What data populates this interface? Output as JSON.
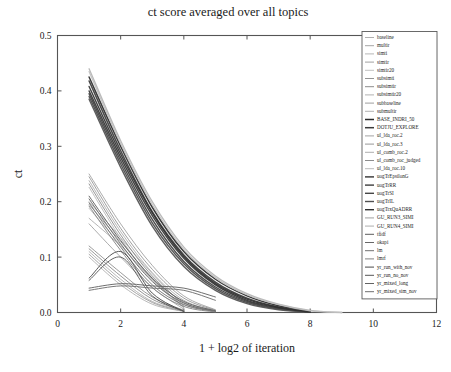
{
  "chart_data": {
    "type": "line",
    "title": "ct score averaged over all topics",
    "xlabel": "1 + log2 of iteration",
    "ylabel": "ct",
    "xlim": [
      0,
      12
    ],
    "ylim": [
      0,
      0.5
    ],
    "xticks": [
      "0",
      "2",
      "4",
      "6",
      "8",
      "10",
      "12"
    ],
    "xtick_values": [
      0,
      2,
      4,
      6,
      8,
      10,
      12
    ],
    "yticks": [
      "0.0",
      "0.1",
      "0.2",
      "0.3",
      "0.4",
      "0.5"
    ],
    "ytick_values": [
      0.0,
      0.1,
      0.2,
      0.3,
      0.4,
      0.5
    ],
    "grid": false,
    "legend_position": "right-outside",
    "x": [
      1,
      2,
      3,
      4,
      5,
      6,
      7,
      8,
      9
    ],
    "series": [
      {
        "name": "baseline",
        "color": "#9a9a9a",
        "width": 0.8,
        "values": [
          0.17,
          0.12,
          0.06,
          0.01,
          null,
          null,
          null,
          null,
          null
        ]
      },
      {
        "name": "multir",
        "color": "#8e8e8e",
        "width": 0.8,
        "values": [
          0.16,
          0.1,
          0.045,
          0.006,
          null,
          null,
          null,
          null,
          null
        ]
      },
      {
        "name": "simti",
        "color": "#a5a5a5",
        "width": 0.8,
        "values": [
          0.2,
          0.135,
          0.07,
          0.012,
          null,
          null,
          null,
          null,
          null
        ]
      },
      {
        "name": "simtir",
        "color": "#8a8a8a",
        "width": 0.8,
        "values": [
          0.195,
          0.128,
          0.062,
          0.009,
          null,
          null,
          null,
          null,
          null
        ]
      },
      {
        "name": "simtir20",
        "color": "#b0b0b0",
        "width": 0.8,
        "values": [
          0.188,
          0.122,
          0.058,
          0.008,
          null,
          null,
          null,
          null,
          null
        ]
      },
      {
        "name": "subsimti",
        "color": "#777777",
        "width": 0.8,
        "values": [
          0.12,
          0.072,
          0.028,
          0.004,
          null,
          null,
          null,
          null,
          null
        ]
      },
      {
        "name": "subsimtir",
        "color": "#6f6f6f",
        "width": 0.8,
        "values": [
          0.115,
          0.066,
          0.024,
          0.003,
          null,
          null,
          null,
          null,
          null
        ]
      },
      {
        "name": "subsimtir20",
        "color": "#9d9d9d",
        "width": 0.8,
        "values": [
          0.11,
          0.06,
          0.02,
          0.003,
          null,
          null,
          null,
          null,
          null
        ]
      },
      {
        "name": "subbaseline",
        "color": "#858585",
        "width": 0.8,
        "values": [
          0.105,
          0.055,
          0.018,
          0.002,
          null,
          null,
          null,
          null,
          null
        ]
      },
      {
        "name": "submultir",
        "color": "#9f9f9f",
        "width": 0.8,
        "values": [
          0.1,
          0.05,
          0.015,
          0.002,
          null,
          null,
          null,
          null,
          null
        ]
      },
      {
        "name": "BASE_INDRI_50",
        "color": "#2a2a2a",
        "width": 1.5,
        "values": [
          0.425,
          0.3,
          0.19,
          0.11,
          0.06,
          0.03,
          0.012,
          0.002,
          null
        ]
      },
      {
        "name": "DOTJU_EXPLORE",
        "color": "#3a3a3a",
        "width": 1.5,
        "values": [
          0.418,
          0.292,
          0.182,
          0.104,
          0.055,
          0.026,
          0.01,
          0.002,
          null
        ]
      },
      {
        "name": "ul_lda_roc.2",
        "color": "#8c8c8c",
        "width": 0.8,
        "values": [
          0.25,
          0.16,
          0.085,
          0.03,
          0.005,
          null,
          null,
          null,
          null
        ]
      },
      {
        "name": "ul_lda_roc.3",
        "color": "#7e7e7e",
        "width": 0.8,
        "values": [
          0.245,
          0.152,
          0.078,
          0.026,
          0.004,
          null,
          null,
          null,
          null
        ]
      },
      {
        "name": "ul_comb_roc.2",
        "color": "#999999",
        "width": 0.8,
        "values": [
          0.238,
          0.146,
          0.072,
          0.022,
          0.003,
          null,
          null,
          null,
          null
        ]
      },
      {
        "name": "ul_comb_roc_judged",
        "color": "#707070",
        "width": 0.8,
        "values": [
          0.232,
          0.14,
          0.066,
          0.018,
          0.002,
          null,
          null,
          null,
          null
        ]
      },
      {
        "name": "ul_lda_roc.10",
        "color": "#a8a8a8",
        "width": 0.8,
        "values": [
          0.226,
          0.134,
          0.06,
          0.015,
          0.002,
          null,
          null,
          null,
          null
        ]
      },
      {
        "name": "uogTrEpsilonG",
        "color": "#333333",
        "width": 1.4,
        "values": [
          0.4,
          0.28,
          0.175,
          0.098,
          0.05,
          0.022,
          0.008,
          0.001,
          null
        ]
      },
      {
        "name": "uogTrRR",
        "color": "#3d3d3d",
        "width": 1.4,
        "values": [
          0.395,
          0.274,
          0.168,
          0.092,
          0.046,
          0.02,
          0.007,
          0.001,
          null
        ]
      },
      {
        "name": "uogTrSI",
        "color": "#464646",
        "width": 1.4,
        "values": [
          0.39,
          0.268,
          0.162,
          0.088,
          0.043,
          0.018,
          0.006,
          0.001,
          null
        ]
      },
      {
        "name": "uogTrIL",
        "color": "#505050",
        "width": 1.4,
        "values": [
          0.385,
          0.262,
          0.156,
          0.083,
          0.04,
          0.016,
          0.005,
          0.001,
          null
        ]
      },
      {
        "name": "uogTrxQuADRR",
        "color": "#2f2f2f",
        "width": 1.4,
        "values": [
          0.408,
          0.286,
          0.18,
          0.101,
          0.052,
          0.024,
          0.009,
          0.001,
          null
        ]
      },
      {
        "name": "GU_RUN3_SIMI",
        "color": "#b4b4b4",
        "width": 1.3,
        "values": [
          0.44,
          0.31,
          0.2,
          0.118,
          0.066,
          0.034,
          0.015,
          0.004,
          0.0
        ]
      },
      {
        "name": "GU_RUN4_SIMI",
        "color": "#c0c0c0",
        "width": 1.3,
        "values": [
          0.435,
          0.305,
          0.195,
          0.114,
          0.063,
          0.032,
          0.014,
          0.003,
          0.0
        ]
      },
      {
        "name": "tfidf",
        "color": "#5c5c5c",
        "width": 1.0,
        "values": [
          0.21,
          0.13,
          0.062,
          0.02,
          0.003,
          null,
          null,
          null,
          null
        ]
      },
      {
        "name": "okapi",
        "color": "#676767",
        "width": 1.0,
        "values": [
          0.205,
          0.124,
          0.056,
          0.017,
          0.002,
          null,
          null,
          null,
          null
        ]
      },
      {
        "name": "lm",
        "color": "#727272",
        "width": 1.0,
        "values": [
          0.198,
          0.118,
          0.05,
          0.014,
          0.002,
          null,
          null,
          null,
          null
        ]
      },
      {
        "name": "lmrf",
        "color": "#838383",
        "width": 1.0,
        "values": [
          0.192,
          0.112,
          0.045,
          0.011,
          0.001,
          null,
          null,
          null,
          null
        ]
      },
      {
        "name": "yr_run_with_nov",
        "color": "#4a4a4a",
        "width": 1.0,
        "values": [
          0.062,
          0.11,
          0.035,
          0.002,
          null,
          null,
          null,
          null,
          null
        ]
      },
      {
        "name": "yr_run_no_nov",
        "color": "#565656",
        "width": 1.0,
        "values": [
          0.058,
          0.1,
          0.03,
          0.002,
          null,
          null,
          null,
          null,
          null
        ]
      },
      {
        "name": "yr_mixed_long",
        "color": "#626262",
        "width": 1.0,
        "values": [
          0.044,
          0.052,
          0.048,
          0.044,
          0.028,
          null,
          null,
          null,
          null
        ]
      },
      {
        "name": "yr_mixed_sim_nov",
        "color": "#6e6e6e",
        "width": 1.0,
        "values": [
          0.04,
          0.048,
          0.044,
          0.04,
          0.022,
          null,
          null,
          null,
          null
        ]
      }
    ]
  },
  "legend": {
    "entries": [
      "baseline",
      "multir",
      "simti",
      "simtir",
      "simtir20",
      "subsimti",
      "subsimtir",
      "subsimtir20",
      "subbaseline",
      "submultir",
      "BASE_INDRI_50",
      "DOTJU_EXPLORE",
      "ul_lda_roc.2",
      "ul_lda_roc.3",
      "ul_comb_roc.2",
      "ul_comb_roc_judged",
      "ul_lda_roc.10",
      "uogTrEpsilonG",
      "uogTrRR",
      "uogTrSI",
      "uogTrIL",
      "uogTrxQuADRR",
      "GU_RUN3_SIMI",
      "GU_RUN4_SIMI",
      "tfidf",
      "okapi",
      "lm",
      "lmrf",
      "yr_run_with_nov",
      "yr_run_no_nov",
      "yr_mixed_long",
      "yr_mixed_sim_nov"
    ]
  },
  "style": {
    "frame_color": "#555555",
    "text_color": "#1a1a1a",
    "background": "#ffffff"
  }
}
